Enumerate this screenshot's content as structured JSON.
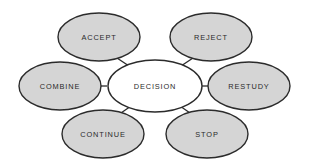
{
  "diagram": {
    "type": "radial-hub-and-spoke",
    "canvas": {
      "width": 309,
      "height": 164,
      "background": "#ffffff"
    },
    "style": {
      "satellite_fill": "#d5d5d5",
      "center_fill": "#ffffff",
      "stroke": "#2b2b2b",
      "text_color": "#2a2a2a"
    },
    "center": {
      "id": "decision",
      "label": "DECISION",
      "cx": 155,
      "cy": 86,
      "rx": 47,
      "ry": 26
    },
    "satellites": [
      {
        "id": "accept",
        "label": "ACCEPT",
        "cx": 99,
        "cy": 37,
        "rx": 41,
        "ry": 24
      },
      {
        "id": "reject",
        "label": "REJECT",
        "cx": 211,
        "cy": 37,
        "rx": 41,
        "ry": 24
      },
      {
        "id": "combine",
        "label": "COMBINE",
        "cx": 60,
        "cy": 86,
        "rx": 41,
        "ry": 24
      },
      {
        "id": "restudy",
        "label": "RESTUDY",
        "cx": 249,
        "cy": 86,
        "rx": 41,
        "ry": 24
      },
      {
        "id": "continue",
        "label": "CONTINUE",
        "cx": 103,
        "cy": 134,
        "rx": 41,
        "ry": 24
      },
      {
        "id": "stop",
        "label": "STOP",
        "cx": 207,
        "cy": 134,
        "rx": 41,
        "ry": 24
      }
    ],
    "connectors": [
      {
        "id": "decision-to-accept",
        "from": "decision",
        "to": "accept",
        "x1": 129,
        "y1": 66,
        "x2": 117,
        "y2": 58
      },
      {
        "id": "decision-to-reject",
        "from": "decision",
        "to": "reject",
        "x1": 181,
        "y1": 66,
        "x2": 193,
        "y2": 58
      },
      {
        "id": "decision-to-combine",
        "from": "decision",
        "to": "combine",
        "x1": 108,
        "y1": 86,
        "x2": 101,
        "y2": 86
      },
      {
        "id": "decision-to-restudy",
        "from": "decision",
        "to": "restudy",
        "x1": 202,
        "y1": 86,
        "x2": 209,
        "y2": 86
      },
      {
        "id": "decision-to-continue",
        "from": "decision",
        "to": "continue",
        "x1": 131,
        "y1": 106,
        "x2": 121,
        "y2": 113
      },
      {
        "id": "decision-to-stop",
        "from": "decision",
        "to": "stop",
        "x1": 180,
        "y1": 106,
        "x2": 190,
        "y2": 113
      }
    ]
  }
}
